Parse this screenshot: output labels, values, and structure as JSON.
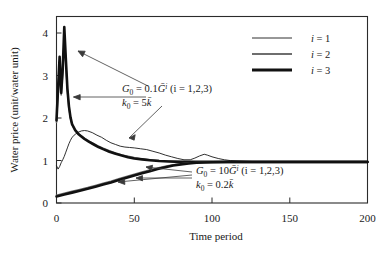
{
  "chart_data": {
    "type": "line",
    "title": "",
    "xlabel": "Time period",
    "ylabel": "Water price (unit/water unit)",
    "xlim": [
      0,
      200
    ],
    "ylim": [
      0,
      4.4
    ],
    "xticks": [
      0,
      50,
      100,
      150,
      200
    ],
    "yticks": [
      0,
      1,
      2,
      3,
      4
    ],
    "xtick_labels": [
      "0",
      "50",
      "100",
      "150",
      "200"
    ],
    "ytick_labels": [
      "0",
      "1",
      "2",
      "3",
      "4"
    ],
    "grid": false,
    "legend_position": "top-right",
    "legend_entries": [
      {
        "label": "i = 1",
        "color": "#1a1a1a",
        "width": 0.9
      },
      {
        "label": "i = 2",
        "color": "#6e6e6e",
        "width": 1.6
      },
      {
        "label": "i = 3",
        "color": "#111111",
        "width": 2.6
      }
    ],
    "series": [
      {
        "name": "i = 1, G0 = 0.1 Gbar",
        "group": "upper",
        "color": "#1a1a1a",
        "width": 0.9,
        "points": [
          [
            0,
            0.88
          ],
          [
            1,
            0.8
          ],
          [
            2,
            0.86
          ],
          [
            3,
            0.95
          ],
          [
            4,
            1.02
          ],
          [
            5,
            1.1
          ],
          [
            6,
            1.2
          ],
          [
            7,
            1.3
          ],
          [
            8,
            1.4
          ],
          [
            9,
            1.48
          ],
          [
            10,
            1.55
          ],
          [
            12,
            1.62
          ],
          [
            14,
            1.67
          ],
          [
            16,
            1.7
          ],
          [
            18,
            1.71
          ],
          [
            20,
            1.7
          ],
          [
            23,
            1.66
          ],
          [
            26,
            1.6
          ],
          [
            29,
            1.55
          ],
          [
            32,
            1.48
          ],
          [
            35,
            1.42
          ],
          [
            38,
            1.38
          ],
          [
            41,
            1.34
          ],
          [
            44,
            1.32
          ],
          [
            47,
            1.31
          ],
          [
            50,
            1.3
          ],
          [
            54,
            1.28
          ],
          [
            58,
            1.26
          ],
          [
            62,
            1.22
          ],
          [
            66,
            1.18
          ],
          [
            70,
            1.13
          ],
          [
            74,
            1.09
          ],
          [
            78,
            1.05
          ],
          [
            82,
            1.02
          ],
          [
            86,
            1.02
          ],
          [
            89,
            1.06
          ],
          [
            92,
            1.11
          ],
          [
            95,
            1.15
          ],
          [
            97,
            1.13
          ],
          [
            100,
            1.09
          ],
          [
            104,
            1.05
          ],
          [
            108,
            1.02
          ],
          [
            112,
            1.0
          ],
          [
            118,
            0.99
          ],
          [
            125,
            0.98
          ],
          [
            135,
            0.97
          ],
          [
            150,
            0.97
          ],
          [
            170,
            0.97
          ],
          [
            200,
            0.97
          ]
        ]
      },
      {
        "name": "i = 2, G0 = 0.1 Gbar",
        "group": "upper",
        "color": "#6e6e6e",
        "width": 1.6,
        "points": [
          [
            0,
            1.9
          ],
          [
            1,
            2.6
          ],
          [
            2,
            3.35
          ],
          [
            3,
            2.55
          ],
          [
            4,
            3.05
          ],
          [
            5,
            3.95
          ],
          [
            6,
            3.3
          ],
          [
            7,
            2.65
          ],
          [
            8,
            2.25
          ],
          [
            9,
            2.0
          ],
          [
            10,
            1.85
          ],
          [
            12,
            1.72
          ],
          [
            14,
            1.64
          ],
          [
            16,
            1.58
          ],
          [
            18,
            1.53
          ],
          [
            21,
            1.46
          ],
          [
            24,
            1.4
          ],
          [
            27,
            1.34
          ],
          [
            30,
            1.29
          ],
          [
            34,
            1.23
          ],
          [
            38,
            1.18
          ],
          [
            42,
            1.13
          ],
          [
            46,
            1.1
          ],
          [
            50,
            1.07
          ],
          [
            55,
            1.04
          ],
          [
            60,
            1.02
          ],
          [
            66,
            1.0
          ],
          [
            72,
            0.99
          ],
          [
            80,
            0.98
          ],
          [
            90,
            0.97
          ],
          [
            100,
            0.97
          ],
          [
            120,
            0.97
          ],
          [
            150,
            0.97
          ],
          [
            200,
            0.97
          ]
        ]
      },
      {
        "name": "i = 3, G0 = 0.1 Gbar",
        "group": "upper",
        "color": "#111111",
        "width": 2.6,
        "points": [
          [
            0,
            1.95
          ],
          [
            1,
            2.7
          ],
          [
            2,
            3.45
          ],
          [
            3,
            2.6
          ],
          [
            4,
            3.15
          ],
          [
            5,
            4.15
          ],
          [
            6,
            3.4
          ],
          [
            7,
            2.7
          ],
          [
            8,
            2.28
          ],
          [
            9,
            2.02
          ],
          [
            10,
            1.86
          ],
          [
            12,
            1.72
          ],
          [
            14,
            1.63
          ],
          [
            16,
            1.57
          ],
          [
            18,
            1.51
          ],
          [
            21,
            1.44
          ],
          [
            24,
            1.38
          ],
          [
            27,
            1.32
          ],
          [
            30,
            1.27
          ],
          [
            34,
            1.21
          ],
          [
            38,
            1.16
          ],
          [
            42,
            1.12
          ],
          [
            46,
            1.08
          ],
          [
            50,
            1.05
          ],
          [
            55,
            1.03
          ],
          [
            60,
            1.01
          ],
          [
            66,
            0.99
          ],
          [
            72,
            0.98
          ],
          [
            80,
            0.97
          ],
          [
            90,
            0.97
          ],
          [
            100,
            0.97
          ],
          [
            120,
            0.97
          ],
          [
            150,
            0.97
          ],
          [
            200,
            0.97
          ]
        ]
      },
      {
        "name": "i = 1, G0 = 10 Gbar",
        "group": "lower",
        "color": "#1a1a1a",
        "width": 0.9,
        "points": [
          [
            0,
            0.17
          ],
          [
            5,
            0.215
          ],
          [
            10,
            0.26
          ],
          [
            15,
            0.305
          ],
          [
            20,
            0.35
          ],
          [
            25,
            0.4
          ],
          [
            30,
            0.45
          ],
          [
            35,
            0.5
          ],
          [
            40,
            0.555
          ],
          [
            45,
            0.61
          ],
          [
            50,
            0.665
          ],
          [
            55,
            0.715
          ],
          [
            60,
            0.765
          ],
          [
            65,
            0.815
          ],
          [
            70,
            0.855
          ],
          [
            75,
            0.89
          ],
          [
            80,
            0.915
          ],
          [
            85,
            0.935
          ],
          [
            90,
            0.95
          ],
          [
            95,
            0.958
          ],
          [
            100,
            0.963
          ],
          [
            110,
            0.967
          ],
          [
            125,
            0.968
          ],
          [
            150,
            0.968
          ],
          [
            200,
            0.968
          ]
        ]
      },
      {
        "name": "i = 2, G0 = 10 Gbar",
        "group": "lower",
        "color": "#6e6e6e",
        "width": 1.6,
        "points": [
          [
            0,
            0.185
          ],
          [
            5,
            0.23
          ],
          [
            10,
            0.275
          ],
          [
            15,
            0.32
          ],
          [
            20,
            0.365
          ],
          [
            25,
            0.415
          ],
          [
            30,
            0.465
          ],
          [
            35,
            0.515
          ],
          [
            40,
            0.57
          ],
          [
            45,
            0.625
          ],
          [
            50,
            0.68
          ],
          [
            55,
            0.73
          ],
          [
            60,
            0.78
          ],
          [
            65,
            0.825
          ],
          [
            70,
            0.865
          ],
          [
            75,
            0.9
          ],
          [
            80,
            0.925
          ],
          [
            85,
            0.942
          ],
          [
            90,
            0.955
          ],
          [
            95,
            0.962
          ],
          [
            100,
            0.966
          ],
          [
            110,
            0.968
          ],
          [
            125,
            0.968
          ],
          [
            150,
            0.968
          ],
          [
            200,
            0.968
          ]
        ]
      },
      {
        "name": "i = 3, G0 = 10 Gbar",
        "group": "lower",
        "color": "#111111",
        "width": 2.6,
        "points": [
          [
            0,
            0.155
          ],
          [
            5,
            0.2
          ],
          [
            10,
            0.245
          ],
          [
            15,
            0.29
          ],
          [
            20,
            0.335
          ],
          [
            25,
            0.385
          ],
          [
            30,
            0.435
          ],
          [
            35,
            0.485
          ],
          [
            40,
            0.54
          ],
          [
            45,
            0.595
          ],
          [
            50,
            0.65
          ],
          [
            55,
            0.7
          ],
          [
            60,
            0.75
          ],
          [
            65,
            0.8
          ],
          [
            70,
            0.845
          ],
          [
            75,
            0.885
          ],
          [
            80,
            0.912
          ],
          [
            85,
            0.933
          ],
          [
            90,
            0.948
          ],
          [
            95,
            0.957
          ],
          [
            100,
            0.962
          ],
          [
            110,
            0.966
          ],
          [
            125,
            0.967
          ],
          [
            150,
            0.967
          ],
          [
            200,
            0.967
          ]
        ]
      }
    ],
    "annotations": [
      {
        "id": "upper-annotation",
        "line1": "G₀ = 0.1Ḡⁱ (i = 1,2,3)",
        "line2": "k₀ = 5k̄",
        "at_x": 120,
        "at_y": 88
      },
      {
        "id": "lower-annotation",
        "line1": "G₀ = 10Ḡⁱ (i = 1,2,3)",
        "line2": "k₀ = 0.2k̄",
        "at_x": 196,
        "at_y": 170
      }
    ],
    "annotation_parts": {
      "upper": {
        "G": "G",
        "zero": "0",
        "eq": " = ",
        "coef": "0.1",
        "Gbar": "Ḡ",
        "i_sup": "i",
        "paren": " (i = 1,2,3)",
        "k": "k",
        "k_eq": " = ",
        "k_val": "5",
        "kbar": "k̄"
      },
      "lower": {
        "G": "G",
        "zero": "0",
        "eq": " = ",
        "coef": "10",
        "Gbar": "Ḡ",
        "i_sup": "i",
        "paren": " (i = 1,2,3)",
        "k": "k",
        "k_eq": " = ",
        "k_val": "0.2",
        "kbar": "k̄"
      }
    }
  },
  "axes": {
    "y_label": "Water price (unit/water unit)",
    "x_label": "Time period",
    "y_ticks": [
      "0",
      "1",
      "2",
      "3",
      "4"
    ],
    "x_ticks": [
      "0",
      "50",
      "100",
      "150",
      "200"
    ]
  },
  "legend": {
    "items": [
      {
        "label": "i = 1",
        "var": "i",
        "eq": "= 1"
      },
      {
        "label": "i = 2",
        "var": "i",
        "eq": "= 2"
      },
      {
        "label": "i = 3",
        "var": "i",
        "eq": "= 3"
      }
    ]
  }
}
